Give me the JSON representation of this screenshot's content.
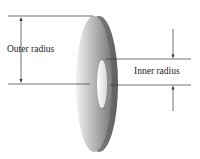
{
  "diagram": {
    "labels": {
      "outer_radius": "Outer radius",
      "inner_radius": "Inner radius"
    },
    "colors": {
      "washer_light": "#e6e6e6",
      "washer_mid": "#a8a8a8",
      "washer_dark": "#6a6a6a",
      "line": "#333333",
      "background": "#ffffff"
    }
  }
}
